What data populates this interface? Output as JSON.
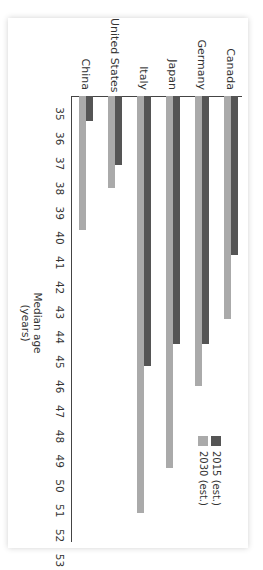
{
  "chart_data": {
    "type": "bar",
    "orientation": "horizontal (image rotated 90° clockwise)",
    "title": "",
    "xlabel": "Median age (years)",
    "ylabel": "",
    "categories": [
      "Canada",
      "Germany",
      "Japan",
      "Italy",
      "United States",
      "China"
    ],
    "series": [
      {
        "name": "2015 (est.)",
        "color": "#555555",
        "values": [
          41.4,
          45.0,
          45.0,
          45.9,
          37.8,
          36.0
        ]
      },
      {
        "name": "2030 (est.)",
        "color": "#aaaaaa",
        "values": [
          44.0,
          46.7,
          50.0,
          51.8,
          38.7,
          40.4
        ]
      }
    ],
    "xlim": [
      35,
      53
    ],
    "xticks": [
      35,
      36,
      37,
      38,
      39,
      40,
      41,
      42,
      43,
      44,
      45,
      46,
      47,
      48,
      49,
      50,
      51,
      52,
      53
    ],
    "grid": false,
    "legend_position": "lower right"
  },
  "axis": {
    "title_line1": "Median age",
    "title_line2": "(years)",
    "ticks": [
      "35",
      "36",
      "37",
      "38",
      "39",
      "40",
      "41",
      "42",
      "43",
      "44",
      "45",
      "46",
      "47",
      "48",
      "49",
      "50",
      "51",
      "52",
      "53"
    ]
  },
  "legend": {
    "items": [
      {
        "label": "2015 (est.)",
        "color": "#555555"
      },
      {
        "label": "2030 (est.)",
        "color": "#aaaaaa"
      }
    ]
  },
  "categories": [
    "Canada",
    "Germany",
    "Japan",
    "Italy",
    "United States",
    "China"
  ]
}
